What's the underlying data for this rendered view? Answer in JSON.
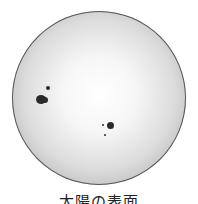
{
  "figure": {
    "caption": "太陽の表面",
    "colors": {
      "limb": "#8e8e8e",
      "center": "#ffffff",
      "spot": "#2a2a2a"
    }
  },
  "sunspots": [
    {
      "group": "left-large",
      "x": 40,
      "y": 99,
      "w": 9,
      "h": 8
    },
    {
      "group": "left-small",
      "x": 48,
      "y": 88,
      "w": 4,
      "h": 4
    },
    {
      "group": "right-large",
      "x": 110,
      "y": 125,
      "w": 6,
      "h": 6
    },
    {
      "group": "right-small",
      "x": 103,
      "y": 125,
      "w": 2,
      "h": 2
    },
    {
      "group": "right-dot",
      "x": 105,
      "y": 135,
      "w": 2,
      "h": 2
    }
  ]
}
